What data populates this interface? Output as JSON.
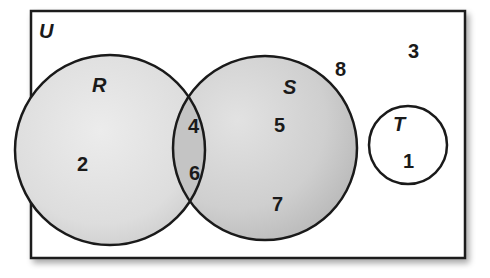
{
  "diagram": {
    "type": "venn",
    "universe": {
      "label": "U",
      "elements_outside_sets": [
        "8",
        "3"
      ]
    },
    "sets": [
      {
        "name": "R",
        "label": "R",
        "only_elements": [
          "2"
        ]
      },
      {
        "name": "S",
        "label": "S",
        "only_elements": [
          "5",
          "7"
        ]
      },
      {
        "name": "T",
        "label": "T",
        "only_elements": [
          "1"
        ]
      }
    ],
    "intersections": {
      "R_and_S": [
        "4",
        "6"
      ]
    },
    "labels": {
      "U": "U",
      "R": "R",
      "S": "S",
      "T": "T"
    },
    "elements": {
      "r_only_2": "2",
      "rs_4": "4",
      "rs_6": "6",
      "s_only_5": "5",
      "s_only_7": "7",
      "outside_8": "8",
      "outside_3": "3",
      "t_only_1": "1"
    },
    "colors": {
      "outline": "#1a1a1a",
      "fill_light": "#e6e6e6",
      "fill_dark": "#b8b8b8",
      "background": "#ffffff"
    }
  }
}
